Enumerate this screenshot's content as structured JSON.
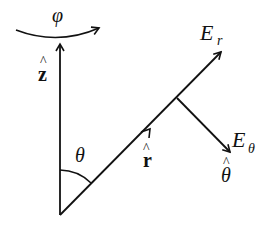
{
  "diagram": {
    "colors": {
      "stroke": "#111111",
      "background": "#ffffff"
    },
    "labels": {
      "phi": "φ",
      "z_hat_letter": "z",
      "hat": "^",
      "r_hat_letter": "r",
      "theta_angle": "θ",
      "E": "E",
      "E_r_sub": "r",
      "E_theta_sub": "θ",
      "theta_hat_letter": "θ"
    },
    "elements": [
      {
        "id": "z-axis",
        "label": "ẑ",
        "type": "arrow"
      },
      {
        "id": "phi-arc",
        "label": "φ",
        "type": "curved-arrow"
      },
      {
        "id": "r-vector",
        "label": "r̂",
        "type": "arrow"
      },
      {
        "id": "E_r",
        "label": "E_r",
        "type": "arrow"
      },
      {
        "id": "E_theta",
        "label": "E_θ",
        "type": "arrow",
        "unit": "θ̂"
      },
      {
        "id": "theta-angle",
        "label": "θ",
        "type": "angle-arc"
      }
    ]
  }
}
